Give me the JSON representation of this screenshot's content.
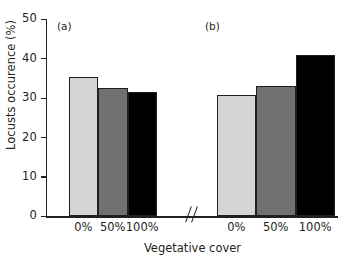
{
  "chart_data": {
    "type": "bar",
    "title": "",
    "xlabel": "Vegetative cover",
    "ylabel": "Locusts occurence (%)",
    "ylim": [
      0,
      50
    ],
    "yticks": [
      0,
      10,
      20,
      30,
      40,
      50
    ],
    "ytick_labels": [
      "0",
      "10",
      "20",
      "30",
      "40",
      "50"
    ],
    "grid": false,
    "legend": "none",
    "axis_break": true,
    "axis_break_symbol": "//",
    "panels": [
      {
        "label": "(a)",
        "categories": [
          "0%",
          "50%",
          "100%"
        ],
        "values": [
          35.5,
          32.6,
          31.5
        ],
        "colors": [
          "#d4d4d4",
          "#717171",
          "#000000"
        ]
      },
      {
        "label": "(b)",
        "categories": [
          "0%",
          "50%",
          "100%"
        ],
        "values": [
          30.7,
          33.0,
          41.0
        ],
        "colors": [
          "#d4d4d4",
          "#717171",
          "#000000"
        ]
      }
    ],
    "series": [
      {
        "name": "0%",
        "values": [
          35.5,
          30.7
        ],
        "color": "#d4d4d4"
      },
      {
        "name": "50%",
        "values": [
          32.6,
          33.0
        ],
        "color": "#717171"
      },
      {
        "name": "100%",
        "values": [
          31.5,
          41.0
        ],
        "color": "#000000"
      }
    ],
    "categories": [
      "(a)",
      "(b)"
    ]
  },
  "colors": {
    "axis": "#231f20",
    "light_gray_bar": "#d4d4d4",
    "medium_gray_bar": "#717171",
    "black_bar": "#000000",
    "background": "#ffffff"
  }
}
